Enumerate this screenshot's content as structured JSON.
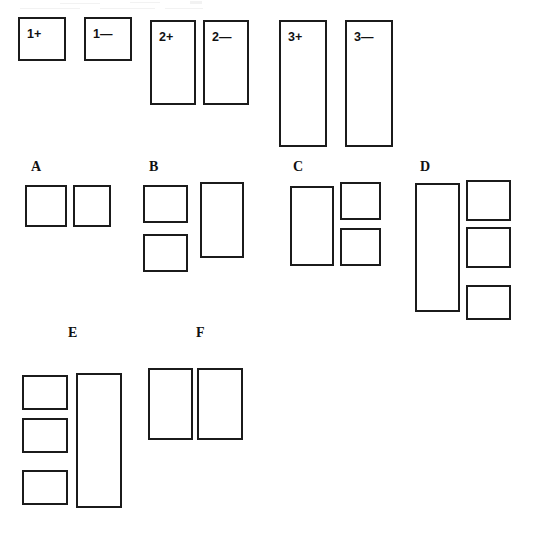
{
  "page": {
    "background_color": "#ffffff",
    "stroke_color": "#1b1b1b",
    "fill_color": "#ffffff",
    "width": 533,
    "height": 534
  },
  "key_row": {
    "name": "key-row",
    "items": [
      {
        "label": "1+",
        "x": 18,
        "y": 17,
        "w": 48,
        "h": 44
      },
      {
        "label": "1—",
        "x": 84,
        "y": 17,
        "w": 48,
        "h": 44
      },
      {
        "label": "2+",
        "x": 150,
        "y": 20,
        "w": 46,
        "h": 85
      },
      {
        "label": "2—",
        "x": 203,
        "y": 20,
        "w": 46,
        "h": 85
      },
      {
        "label": "3+",
        "x": 279,
        "y": 20,
        "w": 48,
        "h": 127
      },
      {
        "label": "3—",
        "x": 345,
        "y": 20,
        "w": 48,
        "h": 127
      }
    ]
  },
  "groups": [
    {
      "label": "A",
      "label_x": 31,
      "label_y": 160,
      "boxes": [
        {
          "x": 25,
          "y": 185,
          "w": 42,
          "h": 42
        },
        {
          "x": 73,
          "y": 185,
          "w": 38,
          "h": 42
        }
      ]
    },
    {
      "label": "B",
      "label_x": 149,
      "label_y": 160,
      "boxes": [
        {
          "x": 143,
          "y": 185,
          "w": 45,
          "h": 38
        },
        {
          "x": 143,
          "y": 234,
          "w": 45,
          "h": 38
        },
        {
          "x": 200,
          "y": 182,
          "w": 44,
          "h": 76
        }
      ]
    },
    {
      "label": "C",
      "label_x": 293,
      "label_y": 160,
      "boxes": [
        {
          "x": 290,
          "y": 186,
          "w": 44,
          "h": 80
        },
        {
          "x": 340,
          "y": 182,
          "w": 41,
          "h": 38
        },
        {
          "x": 340,
          "y": 228,
          "w": 41,
          "h": 38
        }
      ]
    },
    {
      "label": "D",
      "label_x": 420,
      "label_y": 160,
      "boxes": [
        {
          "x": 415,
          "y": 183,
          "w": 45,
          "h": 129
        },
        {
          "x": 466,
          "y": 180,
          "w": 45,
          "h": 41
        },
        {
          "x": 466,
          "y": 227,
          "w": 45,
          "h": 41
        },
        {
          "x": 466,
          "y": 285,
          "w": 45,
          "h": 35
        }
      ]
    },
    {
      "label": "E",
      "label_x": 68,
      "label_y": 326,
      "boxes": [
        {
          "x": 22,
          "y": 375,
          "w": 46,
          "h": 35
        },
        {
          "x": 22,
          "y": 418,
          "w": 46,
          "h": 35
        },
        {
          "x": 22,
          "y": 470,
          "w": 46,
          "h": 35
        },
        {
          "x": 76,
          "y": 373,
          "w": 46,
          "h": 135
        }
      ]
    },
    {
      "label": "F",
      "label_x": 196,
      "label_y": 326,
      "boxes": [
        {
          "x": 148,
          "y": 368,
          "w": 45,
          "h": 72
        },
        {
          "x": 197,
          "y": 368,
          "w": 46,
          "h": 72
        }
      ]
    }
  ],
  "scan_artifacts": [
    {
      "x": 60,
      "y": 3,
      "w": 40,
      "h": 1
    },
    {
      "x": 130,
      "y": 2,
      "w": 30,
      "h": 1
    },
    {
      "x": 190,
      "y": 1,
      "w": 12,
      "h": 3
    },
    {
      "x": 20,
      "y": 8,
      "w": 60,
      "h": 1
    },
    {
      "x": 100,
      "y": 8,
      "w": 55,
      "h": 1
    },
    {
      "x": 165,
      "y": 8,
      "w": 38,
      "h": 1
    }
  ]
}
